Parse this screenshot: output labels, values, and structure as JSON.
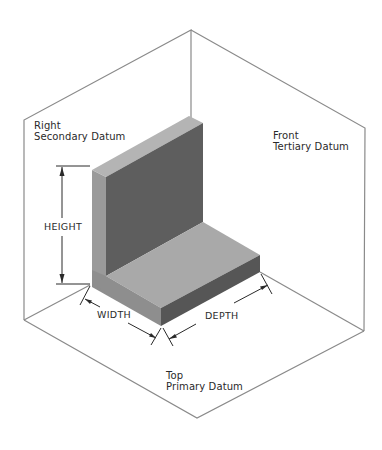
{
  "datums": {
    "right": {
      "line1": "Right",
      "line2": "Secondary Datum"
    },
    "front": {
      "line1": "Front",
      "line2": "Tertiary Datum"
    },
    "top": {
      "line1": "Top",
      "line2": "Primary Datum"
    }
  },
  "dimensions": {
    "height": "HEIGHT",
    "width": "WIDTH",
    "depth": "DEPTH"
  },
  "colors": {
    "frame_line": "#8a8a8a",
    "plane_fill": "#ffffff",
    "wall_front": "#5e5e5e",
    "wall_top": "#b4b4b4",
    "wall_side": "#9a9a9a",
    "base_top": "#a9a9a9",
    "base_front": "#565656",
    "base_side": "#8e8e8e",
    "dim_line": "#2a2a2a"
  }
}
